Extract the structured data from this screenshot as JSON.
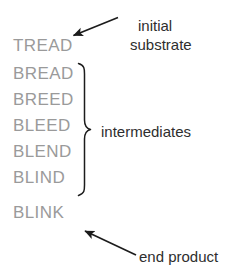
{
  "figure": {
    "background_color": "#ffffff",
    "word_color": "#9a9a9a",
    "annotation_color": "#2e2e2e",
    "line_color": "#1c1c1c"
  },
  "ladder": {
    "words": [
      {
        "text": "TREAD",
        "role": "initial substrate"
      },
      {
        "text": "BREAD",
        "role": "intermediate"
      },
      {
        "text": "BREED",
        "role": "intermediate"
      },
      {
        "text": "BLEED",
        "role": "intermediate"
      },
      {
        "text": "BLEND",
        "role": "intermediate"
      },
      {
        "text": "BLIND",
        "role": "intermediate"
      },
      {
        "text": "BLINK",
        "role": "end product"
      }
    ]
  },
  "annotations": {
    "initial_substrate": {
      "line1": "initial",
      "line2": "substrate"
    },
    "intermediates": "intermediates",
    "end_product": "end product"
  }
}
